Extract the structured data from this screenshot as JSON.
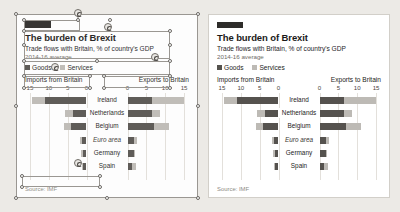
{
  "app": {
    "canvas_background": "#eceae6",
    "mode": "slide-editor-object-selected"
  },
  "chart_card": {
    "kicker_bar": "brand-rule",
    "title": "The burden of Brexit",
    "subtitle": "Trade flows with Britain, % of country's GDP",
    "period": "2014-16 average",
    "source": "Source: IMF",
    "legend": [
      {
        "label": "Goods",
        "color": "#55524e"
      },
      {
        "label": "Services",
        "color": "#bdbab5"
      }
    ]
  },
  "chart_data": {
    "type": "bar",
    "title": "The burden of Brexit",
    "subtitle": "Trade flows with Britain, % of country's GDP",
    "annotation": "2014-16 average",
    "orientation": "horizontal-diverging",
    "categories": [
      "Ireland",
      "Netherlands",
      "Belgium",
      "Euro area",
      "Germany",
      "Spain"
    ],
    "panels": [
      {
        "name": "imports",
        "xlabel": "Imports from Britain",
        "direction": "left",
        "ticks": [
          15,
          10,
          5,
          0
        ],
        "xlim": [
          0,
          15
        ],
        "series": [
          {
            "name": "Goods",
            "color": "#55524e",
            "values": [
              11.0,
              3.6,
              4.2,
              1.1,
              1.0,
              0.9
            ]
          },
          {
            "name": "Services",
            "color": "#bdbab5",
            "values": [
              3.5,
              2.0,
              1.8,
              0.5,
              0.4,
              0.4
            ]
          }
        ]
      },
      {
        "name": "exports",
        "xlabel": "Exports to Britain",
        "direction": "right",
        "ticks": [
          0,
          5,
          10,
          15
        ],
        "xlim": [
          0,
          15
        ],
        "series": [
          {
            "name": "Goods",
            "color": "#55524e",
            "values": [
              6.5,
              6.4,
              7.0,
              1.7,
              1.7,
              1.3
            ]
          },
          {
            "name": "Services",
            "color": "#bdbab5",
            "values": [
              8.5,
              2.1,
              4.0,
              0.7,
              0.3,
              0.9
            ]
          }
        ]
      }
    ],
    "grid": true,
    "legend_position": "top-left",
    "footnote": "Source: IMF"
  }
}
